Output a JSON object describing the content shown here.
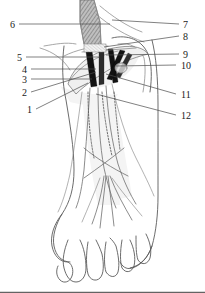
{
  "figure": {
    "view": "anterolateral view of right foot and distal leg",
    "style": "black and white line drawing with grey shading",
    "background_color": "#ffffff",
    "line_color": "#5b5b5b",
    "dark_band_color": "#121212",
    "label_color": "#1a1a1a"
  },
  "labels": {
    "left": [
      {
        "id": "label-6",
        "text": "6",
        "x": 10,
        "y": 28,
        "leader_to_x": 110,
        "leader_to_y": 24
      },
      {
        "id": "label-5",
        "text": "5",
        "x": 17,
        "y": 61,
        "leader_to_x": 100,
        "leader_to_y": 57
      },
      {
        "id": "label-4",
        "text": "4",
        "x": 22,
        "y": 73,
        "leader_to_x": 96,
        "leader_to_y": 69
      },
      {
        "id": "label-3",
        "text": "3",
        "x": 22,
        "y": 82,
        "leader_to_x": 92,
        "leader_to_y": 79
      },
      {
        "id": "label-2",
        "text": "2",
        "x": 22,
        "y": 96,
        "leader_to_x": 96,
        "leader_to_y": 72
      },
      {
        "id": "label-1",
        "text": "1",
        "x": 27,
        "y": 113,
        "leader_to_x": 88,
        "leader_to_y": 83
      }
    ],
    "right": [
      {
        "id": "label-7",
        "text": "7",
        "x": 182,
        "y": 28,
        "leader_to_x": 112,
        "leader_to_y": 20
      },
      {
        "id": "label-8",
        "text": "8",
        "x": 182,
        "y": 40,
        "leader_to_x": 104,
        "leader_to_y": 47
      },
      {
        "id": "label-9",
        "text": "9",
        "x": 182,
        "y": 58,
        "leader_to_x": 106,
        "leader_to_y": 55
      },
      {
        "id": "label-10",
        "text": "10",
        "x": 180,
        "y": 69,
        "leader_to_x": 116,
        "leader_to_y": 66
      },
      {
        "id": "label-11",
        "text": "11",
        "x": 180,
        "y": 98,
        "leader_to_x": 106,
        "leader_to_y": 74
      },
      {
        "id": "label-12",
        "text": "12",
        "x": 180,
        "y": 119,
        "leader_to_x": 96,
        "leader_to_y": 94
      }
    ]
  },
  "structures": {
    "proximal_tendon": "hatched vertical tendon entering from top",
    "retinaculum": "pale band crossing the ankle obliquely",
    "dark_tendon_bands": 4,
    "extensor_tendons_to_toes": 5,
    "dotted_deep_tendons": 3,
    "malleolus": "rounded prominence on lateral side",
    "toes": 5
  }
}
